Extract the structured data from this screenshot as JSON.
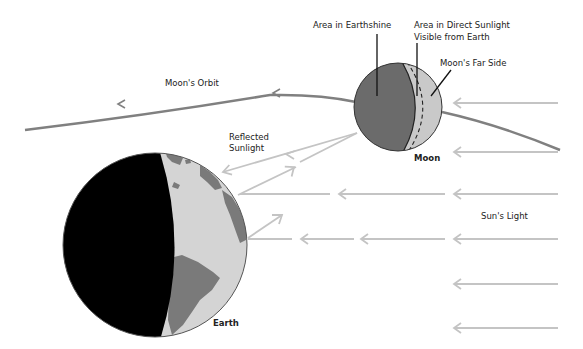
{
  "diagram": {
    "labels": {
      "earthshine": "Area in Earthshine",
      "direct_sunlight_line1": "Area in Direct Sunlight",
      "direct_sunlight_line2": "Visible from Earth",
      "far_side": "Moon's Far Side",
      "orbit": "Moon's Orbit",
      "reflected_line1": "Reflected",
      "reflected_line2": "Sunlight",
      "moon": "Moon",
      "earth": "Earth",
      "suns_light": "Sun's Light"
    },
    "colors": {
      "background": "#ffffff",
      "earth_night": "#000000",
      "earth_ocean": "#d4d4d4",
      "earth_land": "#7a7a7a",
      "moon_earthshine": "#6b6b6b",
      "moon_sunlit": "#c9c9c9",
      "orbit": "#808080",
      "light_rays": "#c4c4c4",
      "text": "#222222"
    }
  }
}
